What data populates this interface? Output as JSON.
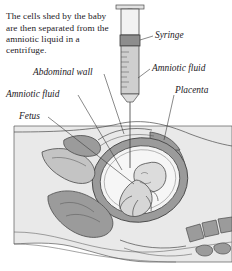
{
  "figure": {
    "caption": "The cells shed by the baby are then separated from the amniotic liquid in a centrifuge.",
    "labels": [
      {
        "id": "syringe",
        "text": "Syringe"
      },
      {
        "id": "amniotic_right",
        "text": "Amniotic fluid"
      },
      {
        "id": "placenta",
        "text": "Placenta"
      },
      {
        "id": "abdominal_wall",
        "text": "Abdominal wall"
      },
      {
        "id": "amniotic_left",
        "text": "Amniotic fluid"
      },
      {
        "id": "fetus",
        "text": "Fetus"
      }
    ],
    "colors": {
      "page_background": "#ffffff",
      "body_fill": "#e9e9e9",
      "organ_fill": "#9b9b9b",
      "organ_fill_light": "#c4c4c4",
      "fluid_fill": "#f2f2f2",
      "fetus_fill": "#d8d8d8",
      "ink": "#4a4a4a",
      "text": "#23201e",
      "syringe_barrel": "#ececec",
      "syringe_fluid": "#c9c9c9",
      "syringe_stopper": "#8d8d8d"
    }
  }
}
